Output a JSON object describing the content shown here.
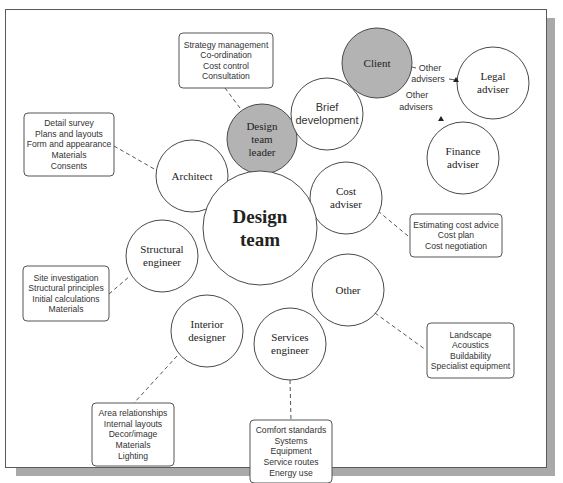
{
  "diagram": {
    "frame": {
      "x": 5,
      "y": 9,
      "width": 542,
      "height": 459,
      "shadow_color": "#a9a9a9"
    },
    "colors": {
      "shaded_node": "#b3b3b3",
      "line": "#555555",
      "circle_stroke": "#4a4a4a"
    },
    "center": {
      "id": "design-team",
      "lines": [
        "Design",
        "team"
      ],
      "cx": 260,
      "cy": 228,
      "r": 57,
      "font": "serif",
      "bold": true,
      "size": 19
    },
    "nodes": [
      {
        "id": "design-team-leader",
        "lines": [
          "Design",
          "team",
          "leader"
        ],
        "cx": 262,
        "cy": 139,
        "r": 35,
        "shaded": true,
        "font": "serif",
        "size": 11
      },
      {
        "id": "brief-development",
        "lines": [
          "Brief",
          "development"
        ],
        "cx": 327,
        "cy": 114,
        "r": 36,
        "shaded": false,
        "font": "sans",
        "size": 11
      },
      {
        "id": "client",
        "lines": [
          "Client"
        ],
        "cx": 377,
        "cy": 63,
        "r": 35,
        "shaded": true,
        "font": "serif",
        "size": 11
      },
      {
        "id": "legal-adviser",
        "lines": [
          "Legal",
          "adviser"
        ],
        "cx": 493,
        "cy": 83,
        "r": 36,
        "shaded": false,
        "font": "serif",
        "size": 11
      },
      {
        "id": "finance-adviser",
        "lines": [
          "Finance",
          "adviser"
        ],
        "cx": 463,
        "cy": 158,
        "r": 36,
        "shaded": false,
        "font": "serif",
        "size": 11
      },
      {
        "id": "architect",
        "lines": [
          "Architect"
        ],
        "cx": 192,
        "cy": 176,
        "r": 36,
        "shaded": false,
        "font": "serif",
        "size": 11
      },
      {
        "id": "cost-adviser",
        "lines": [
          "Cost",
          "adviser"
        ],
        "cx": 346,
        "cy": 198,
        "r": 36,
        "shaded": false,
        "font": "serif",
        "size": 11
      },
      {
        "id": "structural-engineer",
        "lines": [
          "Structural",
          "engineer"
        ],
        "cx": 162,
        "cy": 256,
        "r": 36,
        "shaded": false,
        "font": "serif",
        "size": 11
      },
      {
        "id": "other",
        "lines": [
          "Other"
        ],
        "cx": 348,
        "cy": 290,
        "r": 36,
        "shaded": false,
        "font": "serif",
        "size": 11
      },
      {
        "id": "interior-designer",
        "lines": [
          "Interior",
          "designer"
        ],
        "cx": 207,
        "cy": 331,
        "r": 36,
        "shaded": false,
        "font": "serif",
        "size": 11
      },
      {
        "id": "services-engineer",
        "lines": [
          "Services",
          "engineer"
        ],
        "cx": 290,
        "cy": 344,
        "r": 36,
        "shaded": false,
        "font": "serif",
        "size": 11
      }
    ],
    "notes": [
      {
        "id": "design-team-leader-duties",
        "items": [
          "Strategy management",
          "Co-ordination",
          "Cost control",
          "Consultation"
        ],
        "x": 179,
        "y": 33,
        "w": 94,
        "h": 55,
        "line": {
          "x1": 225,
          "y1": 88,
          "x2": 240,
          "y2": 108
        }
      },
      {
        "id": "architect-duties",
        "items": [
          "Detail survey",
          "Plans and layouts",
          "Form and appearance",
          "Materials",
          "Consents"
        ],
        "x": 24,
        "y": 113,
        "w": 90,
        "h": 63,
        "line": {
          "x1": 114,
          "y1": 146,
          "x2": 156,
          "y2": 170
        }
      },
      {
        "id": "cost-adviser-duties",
        "items": [
          "Estimating cost advice",
          "Cost plan",
          "Cost negotiation"
        ],
        "x": 410,
        "y": 214,
        "w": 92,
        "h": 43,
        "line": {
          "x1": 378,
          "y1": 211,
          "x2": 408,
          "y2": 236
        }
      },
      {
        "id": "structural-engineer-duties",
        "items": [
          "Site investigation",
          "Structural principles",
          "Initial calculations",
          "Materials"
        ],
        "x": 23,
        "y": 266,
        "w": 86,
        "h": 55,
        "line": {
          "x1": 109,
          "y1": 294,
          "x2": 130,
          "y2": 276
        }
      },
      {
        "id": "other-duties",
        "items": [
          "Landscape",
          "Acoustics",
          "Buildability",
          "Specialist equipment"
        ],
        "x": 427,
        "y": 323,
        "w": 87,
        "h": 55,
        "line": {
          "x1": 375,
          "y1": 313,
          "x2": 426,
          "y2": 350
        }
      },
      {
        "id": "interior-designer-duties",
        "items": [
          "Area relationships",
          "Internal layouts",
          "Decor/image",
          "Materials",
          "Lighting"
        ],
        "x": 92,
        "y": 403,
        "w": 82,
        "h": 63,
        "line": {
          "x1": 177,
          "y1": 356,
          "x2": 134,
          "y2": 403
        }
      },
      {
        "id": "services-engineer-duties",
        "items": [
          "Comfort standards",
          "Systems",
          "Equipment",
          "Service routes",
          "Energy use"
        ],
        "x": 250,
        "y": 420,
        "w": 82,
        "h": 63,
        "line": {
          "x1": 290,
          "y1": 380,
          "x2": 291,
          "y2": 420
        }
      }
    ],
    "adviser_links": [
      {
        "id": "client-to-legal",
        "label_lines": [
          "Other",
          "advisers"
        ],
        "label_x": [
          430,
          428
        ],
        "label_y": [
          71,
          82
        ],
        "dash1": {
          "x1": 412,
          "y1": 67,
          "x2": 416,
          "y2": 68
        },
        "dash2": {
          "x1": 449,
          "y1": 79,
          "x2": 455,
          "y2": 80
        },
        "arrow": {
          "x": 456,
          "y": 80
        }
      },
      {
        "id": "client-to-finance",
        "label_lines": [
          "Other",
          "advisers"
        ],
        "label_x": [
          417,
          416
        ],
        "label_y": [
          98,
          110
        ],
        "arrow": {
          "x": 441,
          "y": 119
        }
      }
    ]
  }
}
